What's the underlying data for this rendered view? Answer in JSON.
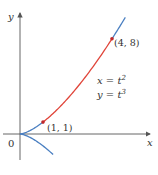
{
  "diagram": {
    "type": "parametric-curve",
    "axes": {
      "x_label": "x",
      "y_label": "y",
      "origin_label": "0"
    },
    "equations": {
      "x_eq": "x = t",
      "x_exp": "2",
      "y_eq": "y = t",
      "y_exp": "3"
    },
    "points": [
      {
        "label": "(1, 1)",
        "t": 1,
        "x": 1,
        "y": 1
      },
      {
        "label": "(4, 8)",
        "t": 2,
        "x": 4,
        "y": 8
      }
    ],
    "highlight_segment": {
      "t_from": 1,
      "t_to": 2,
      "color": "#e0453a"
    },
    "curve_color": "#4a7fc1",
    "axis_color": "#555555"
  }
}
